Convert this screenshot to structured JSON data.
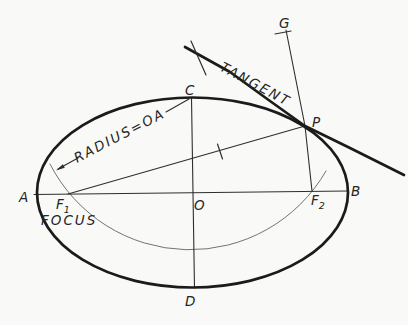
{
  "figure": {
    "colors": {
      "background": "#f9f9f7",
      "ink": "#1b1b1b",
      "thin_line": "#2e2e2e",
      "construction_arc": "#737371"
    },
    "labels": {
      "a": "A",
      "b": "B",
      "c": "C",
      "d": "D",
      "o": "O",
      "p": "P",
      "g": "G",
      "f1_base": "F",
      "f1_sub": "1",
      "f2_base": "F",
      "f2_sub": "2",
      "focus": "FOCUS",
      "tangent": "TANGENT",
      "radius_note": "RADIUS=OA"
    }
  }
}
